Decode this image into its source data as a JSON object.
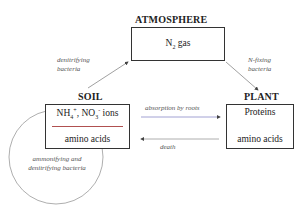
{
  "atmosphere": {
    "heading": "ATMOSPHERE",
    "box_text_main": "N",
    "box_text_sub": "2",
    "box_text_rest": " gas"
  },
  "soil": {
    "heading": "SOIL",
    "line1_a": "NH",
    "line1_a_sub": "4",
    "line1_a_sup": "+",
    "line1_sep": ", NO",
    "line1_b_sub": "3",
    "line1_b_sup": "-",
    "line1_rest": " ions",
    "line2": "amino acids"
  },
  "plant": {
    "heading": "PLANT",
    "line1": "Proteins",
    "line2": "amino acids"
  },
  "labels": {
    "denitrifying_1": "denitrifying",
    "denitrifying_2": "bacteria",
    "nfixing_1": "N-fixing",
    "nfixing_2": "bacteria",
    "absorption": "absorption by roots",
    "death": "death",
    "circle_1": "ammonifying and",
    "circle_2": "denitrifying bacteria"
  },
  "colors": {
    "box_border": "#333333",
    "arrow": "#888888",
    "absorption_arrow": "#8a8ac8",
    "soil_divider": "#b05050",
    "circle": "#999999"
  }
}
